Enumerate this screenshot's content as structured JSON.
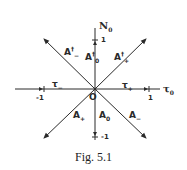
{
  "figure": {
    "caption": "Fig. 5.1",
    "axes": {
      "horizontal": {
        "name": "τ",
        "subscript": "0",
        "tick_pos": "1",
        "tick_neg": "-1"
      },
      "vertical": {
        "name": "N",
        "subscript": "0",
        "tick_pos": "1",
        "tick_neg": "-1"
      },
      "origin": "O"
    },
    "region_labels": {
      "upper_left": {
        "base": "A",
        "sup": "†",
        "sub": "−"
      },
      "upper_center": {
        "base": "A",
        "sup": "†",
        "sub": "0"
      },
      "upper_right": {
        "base": "A",
        "sup": "†",
        "sub": "+"
      },
      "left": {
        "base": "τ",
        "sub": "−"
      },
      "right": {
        "base": "τ",
        "sub": "+"
      },
      "lower_left": {
        "base": "A",
        "sub": "+"
      },
      "lower_center": {
        "base": "A",
        "sub": "0"
      },
      "lower_right": {
        "base": "A",
        "sub": "−"
      }
    },
    "colors": {
      "line": "#2a2a2a",
      "background": "#ffffff"
    }
  }
}
